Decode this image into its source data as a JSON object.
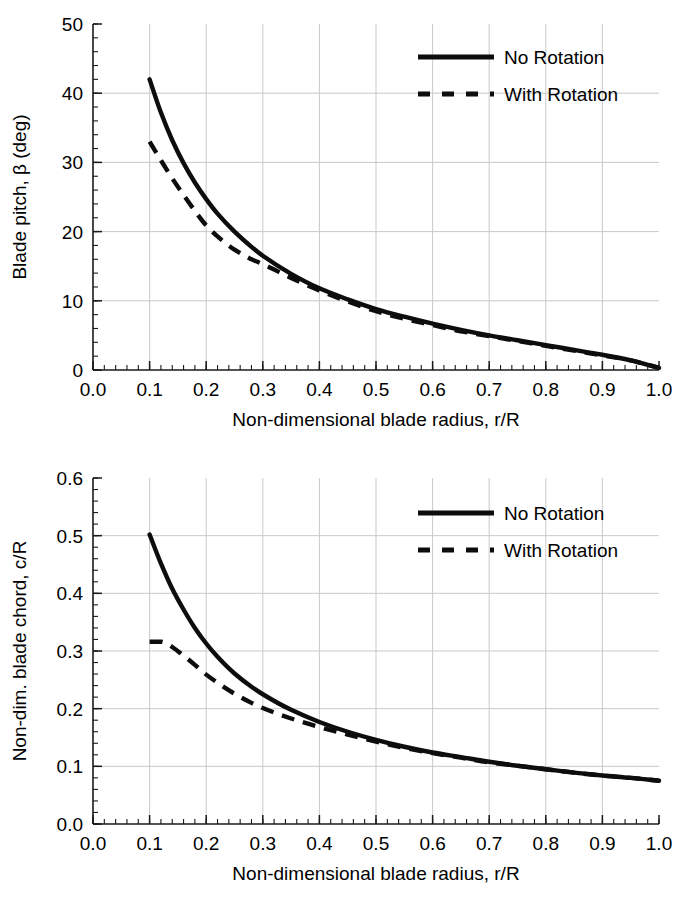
{
  "chart_data": [
    {
      "id": "blade-pitch",
      "type": "line",
      "title": "",
      "xlabel": "Non-dimensional blade radius, r/R",
      "ylabel": "Blade pitch, β (deg)",
      "xlim": [
        0.0,
        1.0
      ],
      "ylim": [
        0,
        50
      ],
      "xticks": [
        "0.0",
        "0.1",
        "0.2",
        "0.3",
        "0.4",
        "0.5",
        "0.6",
        "0.7",
        "0.8",
        "0.9",
        "1.0"
      ],
      "xtick_values": [
        0.0,
        0.1,
        0.2,
        0.3,
        0.4,
        0.5,
        0.6,
        0.7,
        0.8,
        0.9,
        1.0
      ],
      "yticks": [
        "0",
        "10",
        "20",
        "30",
        "40",
        "50"
      ],
      "ytick_values": [
        0,
        10,
        20,
        30,
        40,
        50
      ],
      "x_minor_step": 0.02,
      "y_minor_step": 2,
      "grid": true,
      "legend_position": "top-right",
      "series": [
        {
          "name": "No Rotation",
          "style": "solid",
          "x": [
            0.1,
            0.12,
            0.14,
            0.16,
            0.18,
            0.2,
            0.22,
            0.25,
            0.28,
            0.3,
            0.35,
            0.4,
            0.45,
            0.5,
            0.55,
            0.6,
            0.65,
            0.7,
            0.75,
            0.8,
            0.85,
            0.9,
            0.95,
            1.0
          ],
          "y": [
            42.0,
            37.2,
            33.2,
            29.9,
            27.1,
            24.7,
            22.6,
            20.0,
            17.8,
            16.5,
            13.9,
            11.8,
            10.2,
            8.8,
            7.7,
            6.7,
            5.8,
            5.0,
            4.3,
            3.6,
            2.9,
            2.2,
            1.4,
            0.3
          ]
        },
        {
          "name": "With Rotation",
          "style": "dashed",
          "x": [
            0.1,
            0.12,
            0.14,
            0.16,
            0.18,
            0.2,
            0.22,
            0.25,
            0.28,
            0.3,
            0.35,
            0.4,
            0.45,
            0.5,
            0.55,
            0.6,
            0.65,
            0.7,
            0.75,
            0.8,
            0.85,
            0.9,
            0.95,
            1.0
          ],
          "y": [
            33.0,
            30.3,
            27.7,
            25.3,
            23.0,
            20.9,
            19.3,
            17.4,
            16.0,
            15.3,
            13.3,
            11.5,
            9.9,
            8.5,
            7.4,
            6.5,
            5.6,
            4.9,
            4.2,
            3.5,
            2.8,
            2.1,
            1.4,
            0.3
          ]
        }
      ]
    },
    {
      "id": "blade-chord",
      "type": "line",
      "title": "",
      "xlabel": "Non-dimensional blade radius, r/R",
      "ylabel": "Non-dim. blade chord, c/R",
      "xlim": [
        0.0,
        1.0
      ],
      "ylim": [
        0.0,
        0.6
      ],
      "xticks": [
        "0.0",
        "0.1",
        "0.2",
        "0.3",
        "0.4",
        "0.5",
        "0.6",
        "0.7",
        "0.8",
        "0.9",
        "1.0"
      ],
      "xtick_values": [
        0.0,
        0.1,
        0.2,
        0.3,
        0.4,
        0.5,
        0.6,
        0.7,
        0.8,
        0.9,
        1.0
      ],
      "yticks": [
        "0.0",
        "0.1",
        "0.2",
        "0.3",
        "0.4",
        "0.5",
        "0.6"
      ],
      "ytick_values": [
        0.0,
        0.1,
        0.2,
        0.3,
        0.4,
        0.5,
        0.6
      ],
      "x_minor_step": 0.02,
      "y_minor_step": 0.02,
      "grid": true,
      "legend_position": "top-right",
      "series": [
        {
          "name": "No Rotation",
          "style": "solid",
          "x": [
            0.1,
            0.12,
            0.14,
            0.16,
            0.18,
            0.2,
            0.22,
            0.25,
            0.28,
            0.3,
            0.35,
            0.4,
            0.45,
            0.5,
            0.55,
            0.6,
            0.65,
            0.7,
            0.75,
            0.8,
            0.85,
            0.9,
            0.95,
            1.0
          ],
          "y": [
            0.502,
            0.452,
            0.408,
            0.372,
            0.34,
            0.313,
            0.29,
            0.261,
            0.238,
            0.225,
            0.198,
            0.177,
            0.16,
            0.146,
            0.134,
            0.124,
            0.116,
            0.108,
            0.101,
            0.095,
            0.089,
            0.084,
            0.08,
            0.075
          ]
        },
        {
          "name": "With Rotation",
          "style": "dashed",
          "x": [
            0.1,
            0.12,
            0.13,
            0.14,
            0.16,
            0.18,
            0.2,
            0.22,
            0.25,
            0.28,
            0.3,
            0.35,
            0.4,
            0.45,
            0.5,
            0.55,
            0.6,
            0.65,
            0.7,
            0.75,
            0.8,
            0.85,
            0.9,
            0.95,
            1.0
          ],
          "y": [
            0.316,
            0.316,
            0.313,
            0.307,
            0.292,
            0.276,
            0.259,
            0.245,
            0.226,
            0.21,
            0.201,
            0.183,
            0.168,
            0.155,
            0.143,
            0.132,
            0.123,
            0.115,
            0.107,
            0.101,
            0.095,
            0.089,
            0.084,
            0.08,
            0.075
          ]
        }
      ]
    }
  ],
  "legend": {
    "entries": [
      {
        "label": "No Rotation",
        "style": "solid"
      },
      {
        "label": "With Rotation",
        "style": "dashed"
      }
    ]
  },
  "colors": {
    "line": "#0d0d0d",
    "grid": "#c9c9c9",
    "axis": "#1a1a1a",
    "background": "#ffffff"
  }
}
